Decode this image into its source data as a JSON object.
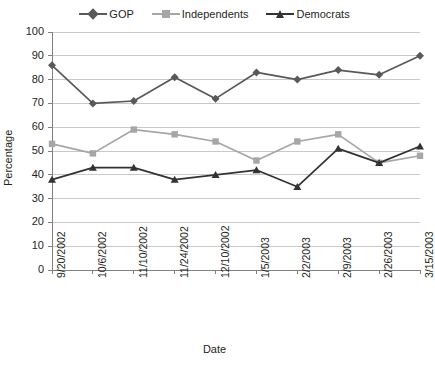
{
  "chart_data": {
    "type": "line",
    "title": "",
    "xlabel": "Date",
    "ylabel": "Percentage",
    "ylim": [
      0,
      100
    ],
    "ytick_step": 10,
    "yticks": [
      100,
      90,
      80,
      70,
      60,
      50,
      40,
      30,
      20,
      10,
      0
    ],
    "grid": true,
    "legend_position": "top-center",
    "categories": [
      "9/20/2002",
      "10/6/2002",
      "11/10/2002",
      "11/24/2002",
      "12/10/2002",
      "1/5/2003",
      "2/2/2003",
      "2/9/2003",
      "2/26/2003",
      "3/15/2003"
    ],
    "series": [
      {
        "name": "GOP",
        "marker": "diamond",
        "color": "#595959",
        "values": [
          86,
          70,
          71,
          81,
          72,
          83,
          80,
          84,
          82,
          90
        ]
      },
      {
        "name": "Independents",
        "marker": "square",
        "color": "#a6a6a6",
        "values": [
          53,
          49,
          59,
          57,
          54,
          46,
          54,
          57,
          45,
          48
        ]
      },
      {
        "name": "Democrats",
        "marker": "triangle",
        "color": "#333333",
        "values": [
          38,
          43,
          43,
          38,
          40,
          42,
          35,
          51,
          45,
          52
        ]
      }
    ]
  },
  "legend": {
    "items": [
      {
        "label": "GOP"
      },
      {
        "label": "Independents"
      },
      {
        "label": "Democrats"
      }
    ]
  },
  "axes": {
    "y_title": "Percentage",
    "x_title": "Date"
  },
  "colors": {
    "gop": "#595959",
    "independents": "#a6a6a6",
    "democrats": "#333333",
    "grid": "#c9c9c9",
    "axis": "#808080",
    "text": "#231f20",
    "background": "#ffffff"
  }
}
